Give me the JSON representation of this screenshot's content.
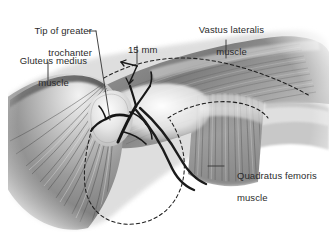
{
  "figure": {
    "kind": "anatomical-illustration",
    "style": "grayscale medical drawing on white background",
    "background_color": "#ffffff",
    "label_color": "#2b2b2b",
    "leader_color": "#3a3a3a",
    "dashed_color": "#222222",
    "vessel_color": "#1d1d1d"
  },
  "labels": [
    {
      "id": "tip-of-greater-trochanter",
      "line1": "Tip of greater",
      "line2": "trochanter",
      "align": "right",
      "x": 8,
      "y": 14,
      "w": 86
    },
    {
      "id": "gluteus-medius-muscle",
      "line1": "Gluteus medius",
      "line2": "muscle",
      "align": "center",
      "x": 4,
      "y": 44,
      "w": 88
    },
    {
      "id": "fifteen-millimetres",
      "line1": "15 mm",
      "line2": "",
      "align": "center",
      "x": 118,
      "y": 33,
      "w": 40
    },
    {
      "id": "vastus-lateralis-muscle",
      "line1": "Vastus lateralis",
      "line2": "muscle",
      "align": "center",
      "x": 182,
      "y": 13,
      "w": 88
    },
    {
      "id": "quadratus-femoris-muscle",
      "line1": "Quadratus femoris",
      "line2": "muscle",
      "align": "left",
      "x": 224,
      "y": 158,
      "w": 100
    }
  ],
  "measurement": {
    "value": "15",
    "unit": "mm",
    "text": "15 mm",
    "arrow": "double-headed"
  },
  "annotations": {
    "dashed_outlines": [
      "trochanteric bursa / resection outline (lower centre oval)",
      "vastus lateralis origin ridge (upper dashed curve)",
      "quadratus femoris superior border (right dashed curve)"
    ],
    "vessels": "branching retinacular vessels over the trochanter",
    "suture_loop": "dark encircling suture / vessel loop below trochanter"
  }
}
